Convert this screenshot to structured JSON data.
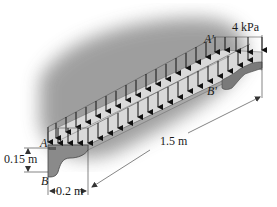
{
  "figure": {
    "type": "engineering free-body/loading diagram"
  },
  "load": {
    "label": "4 kPa",
    "value": 4,
    "unit": "kPa",
    "arrow_rows": 2,
    "arrows_per_row": 21
  },
  "points": {
    "A": "A",
    "B": "B",
    "A_prime": "A'",
    "B_prime": "B'"
  },
  "dimensions": {
    "height": "0.15 m",
    "width": "0.2 m",
    "length": "1.5 m"
  },
  "colors": {
    "shadow": "#9a9a9a",
    "beam_top": "#d8d8d8",
    "beam_face": "#8c8c8c",
    "beam_dark": "#6a6a6a",
    "arrow": "#111111",
    "dim_line": "#333333"
  }
}
